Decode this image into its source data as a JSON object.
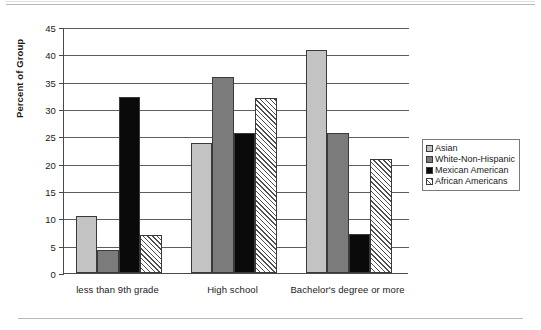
{
  "chart_data": {
    "type": "bar",
    "title": "",
    "subtitle": "",
    "xlabel": "",
    "ylabel": "Percent of Group",
    "ylim": [
      0,
      45
    ],
    "ytick_step": 5,
    "yticks": [
      "45",
      "40",
      "35",
      "30",
      "25",
      "20",
      "15",
      "10",
      "5",
      "0"
    ],
    "grid": true,
    "legend_position": "right",
    "categories": [
      "less than 9th grade",
      "High school",
      "Bachelor's degree or more"
    ],
    "series": [
      {
        "name": "Asian",
        "swatch": "light-gray",
        "color": "#c3c3c3",
        "values": [
          10.5,
          23.7,
          40.8
        ]
      },
      {
        "name": "White-Non-Hispanic",
        "swatch": "medium-gray",
        "color": "#7b7b7b",
        "values": [
          4.2,
          35.8,
          25.6
        ]
      },
      {
        "name": "Mexican American",
        "swatch": "black",
        "color": "#0a0a0a",
        "values": [
          32.2,
          25.6,
          7.2
        ]
      },
      {
        "name": "African Americans",
        "swatch": "diagonal-hatch",
        "color": "#ffffff",
        "values": [
          7.0,
          32.0,
          20.8
        ]
      }
    ]
  },
  "legend": {
    "items": [
      {
        "label": "Asian"
      },
      {
        "label": "White-Non-Hispanic"
      },
      {
        "label": "Mexican American"
      },
      {
        "label": "African Americans"
      }
    ]
  }
}
